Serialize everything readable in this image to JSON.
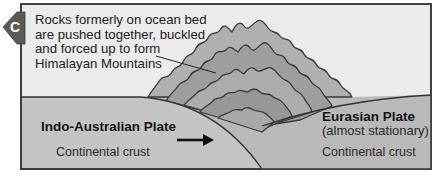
{
  "panel_label": "C",
  "caption": {
    "lines": [
      "Rocks formerly on ocean bed",
      "are pushed together, buckled",
      "and forced up to form",
      "Himalayan Mountains"
    ]
  },
  "plates": {
    "left": {
      "name": "Indo-Australian Plate",
      "crust": "Continental crust",
      "motion": "arrow pointing right"
    },
    "right": {
      "name": "Eurasian Plate",
      "note": "(almost stationary)",
      "crust": "Continental crust"
    }
  },
  "colors": {
    "background": "#ebebeb",
    "frame": "#3a3a3a",
    "plate_fill": "#b9b9b9",
    "indo_plate_fill": "#c4c4c4",
    "mountain_band_light": "#a6a6a6",
    "mountain_band_dark": "#8f8f8f",
    "tab_fill": "#5a5a5a",
    "line": "#333333"
  }
}
